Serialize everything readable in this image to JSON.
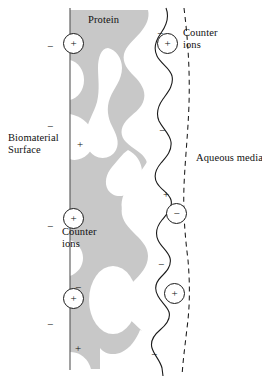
{
  "figure": {
    "type": "schematic-diagram",
    "background_color": "#ffffff",
    "protein_fill_color": "#c8c8c8",
    "line_color": "#1a1a1a"
  },
  "labels": {
    "protein": "Protein",
    "biomaterial_surface": "Biomaterial\nSurface",
    "counter_ions_right": "Counter\nions",
    "counter_ions_left": "Counter\nions",
    "aqueous_media": "Aqueous media"
  },
  "charges": {
    "plain": [
      {
        "id": "minus-left-1",
        "sign": "−",
        "x": 44,
        "y": 40
      },
      {
        "id": "minus-left-2",
        "sign": "−",
        "x": 44,
        "y": 120
      },
      {
        "id": "plus-left-1",
        "sign": "+",
        "x": 74,
        "y": 138
      },
      {
        "id": "minus-left-3",
        "sign": "−",
        "x": 44,
        "y": 220
      },
      {
        "id": "minus-left-4",
        "sign": "−",
        "x": 72,
        "y": 281
      },
      {
        "id": "minus-left-5",
        "sign": "−",
        "x": 44,
        "y": 318
      },
      {
        "id": "plus-left-2",
        "sign": "+",
        "x": 72,
        "y": 342
      },
      {
        "id": "minus-right-1",
        "sign": "−",
        "x": 154,
        "y": 27
      },
      {
        "id": "minus-right-2",
        "sign": "−",
        "x": 156,
        "y": 124
      },
      {
        "id": "plus-right-1",
        "sign": "+",
        "x": 160,
        "y": 188
      },
      {
        "id": "minus-right-3",
        "sign": "−",
        "x": 155,
        "y": 258
      },
      {
        "id": "minus-right-4",
        "sign": "−",
        "x": 148,
        "y": 348
      }
    ],
    "circled": [
      {
        "id": "counter-ion-plus-left-top",
        "sign": "+",
        "x": 63,
        "y": 33
      },
      {
        "id": "counter-ion-plus-right-top",
        "sign": "+",
        "x": 157,
        "y": 33
      },
      {
        "id": "counter-ion-plus-left-mid",
        "sign": "+",
        "x": 63,
        "y": 208
      },
      {
        "id": "counter-ion-minus-right-mid",
        "sign": "−",
        "x": 166,
        "y": 203
      },
      {
        "id": "counter-ion-plus-left-low",
        "sign": "+",
        "x": 63,
        "y": 288
      },
      {
        "id": "counter-ion-plus-right-low",
        "sign": "+",
        "x": 164,
        "y": 283
      }
    ]
  },
  "geometry": {
    "surface_line_x": 70,
    "surface_line_label": "biomaterial-surface-line",
    "wavy_boundary_label": "protein-solution-boundary",
    "dashed_line_label": "diffuse-layer-boundary"
  }
}
